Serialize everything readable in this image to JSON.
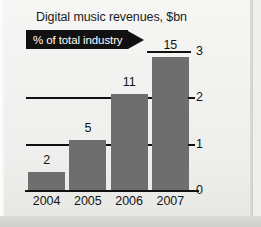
{
  "chart_data": {
    "type": "bar",
    "title": "Digital music revenues, $bn",
    "banner_label": "% of total industry",
    "categories": [
      "2004",
      "2005",
      "2006",
      "2007"
    ],
    "values": [
      0.4,
      1.1,
      2.1,
      2.9
    ],
    "data_labels": [
      "2",
      "5",
      "11",
      "15"
    ],
    "series": [
      {
        "name": "Digital music revenues, $bn",
        "values": [
          0.4,
          1.1,
          2.1,
          2.9
        ]
      }
    ],
    "percent_of_total_industry": [
      2,
      5,
      11,
      15
    ],
    "xlabel": "",
    "ylabel": "",
    "ylim": [
      0,
      3
    ],
    "yticks": [
      "0",
      "1",
      "2",
      "3"
    ],
    "ytick_values": [
      0,
      1,
      2,
      3
    ],
    "y_axis_position": "right",
    "grid": true,
    "gridlines": [
      {
        "value": "1",
        "span": "full"
      },
      {
        "value": "2",
        "span": "full"
      },
      {
        "value": "3",
        "span": "short"
      }
    ],
    "legend": "none",
    "colors": {
      "bar_fill": "#6e6e6e",
      "axis": "#111111",
      "banner_background": "#111111",
      "banner_text": "#ffffff",
      "text": "#141414",
      "background": "#f2f2f0"
    }
  }
}
